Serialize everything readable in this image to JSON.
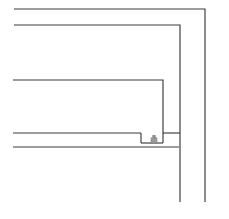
{
  "drawing": {
    "title": "Technical Line Drawing",
    "kind": "cad-section-detail",
    "canvas": {
      "width": 229,
      "height": 219,
      "background": "#ffffff"
    },
    "stroke": {
      "color": "#3a3a3a",
      "width": 1.15
    },
    "paths": [
      {
        "name": "outer-frame-profile",
        "label": "Outer frame profile",
        "d": "M 14 9 L 205 9 L 205 202"
      },
      {
        "name": "outer-frame-inner-offset",
        "label": "Outer frame inner offset",
        "d": "M 14 25 L 180 25 L 180 202"
      },
      {
        "name": "second-frame-profile",
        "label": "Second frame profile",
        "d": "M 13 80 L 163 80 L 163 143"
      },
      {
        "name": "rail-top-edge",
        "label": "Rail top edge",
        "d": "M 13 133 L 141 133"
      },
      {
        "name": "notch-left-wall",
        "label": "Notch left wall",
        "d": "M 141 133 L 141 143"
      },
      {
        "name": "rail-bottom-edge",
        "label": "Rail bottom edge",
        "d": "M 13 147 L 179 147"
      },
      {
        "name": "notch-floor",
        "label": "Notch floor",
        "d": "M 141 143 L 163 143"
      },
      {
        "name": "mid-tie-line",
        "label": "Mid tie line",
        "d": "M 163 133 L 180 133"
      }
    ],
    "fastener": {
      "name": "fastener-head",
      "label": "Fastener head",
      "color": "#9a9a9a",
      "x": 151,
      "y": 135,
      "width": 6,
      "height": 8
    }
  }
}
